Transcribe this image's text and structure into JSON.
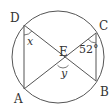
{
  "diagram": {
    "type": "circle-intersecting-chords",
    "colors": {
      "stroke": "#555555",
      "text": "#333333",
      "background": "#ffffff"
    },
    "circle": {
      "cx": 58,
      "cy": 57,
      "r": 46
    },
    "points": {
      "D": {
        "label": "D",
        "x": 24,
        "y": 25,
        "lx": 10,
        "ly": 22
      },
      "C": {
        "label": "C",
        "x": 96,
        "y": 33,
        "lx": 99,
        "ly": 30
      },
      "A": {
        "label": "A",
        "x": 24,
        "y": 89,
        "lx": 14,
        "ly": 103
      },
      "B": {
        "label": "B",
        "x": 96,
        "y": 81,
        "lx": 100,
        "ly": 96
      },
      "E": {
        "label": "E",
        "x": 63,
        "y": 61,
        "lx": 59,
        "ly": 56
      }
    },
    "segments": [
      {
        "from": "D",
        "to": "A"
      },
      {
        "from": "C",
        "to": "B"
      },
      {
        "from": "D",
        "to": "B"
      },
      {
        "from": "C",
        "to": "A"
      }
    ],
    "angles": {
      "x": {
        "label": "x",
        "at": "D",
        "lx": 27,
        "ly": 45
      },
      "c": {
        "label": "52°",
        "at": "C",
        "lx": 79,
        "ly": 53
      },
      "y": {
        "label": "y",
        "at": "E",
        "lx": 61,
        "ly": 77
      }
    }
  }
}
